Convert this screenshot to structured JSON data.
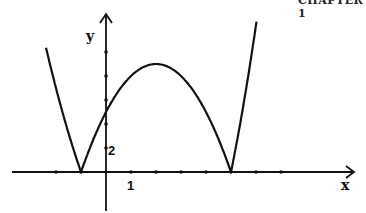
{
  "header": {
    "text": "CHAPTER 1"
  },
  "chart_data": {
    "type": "line",
    "title": "",
    "xlabel": "x",
    "ylabel": "y",
    "function": "y = |x^2 - 4x - 5|",
    "tick_labels": {
      "x": [
        "1"
      ],
      "y": [
        "2"
      ]
    },
    "x_ticks": [
      -2,
      -1,
      1,
      2,
      3,
      4,
      5,
      6,
      7
    ],
    "y_ticks": [
      2,
      4,
      6,
      8,
      10
    ],
    "xlim": [
      -3.8,
      10
    ],
    "ylim": [
      -3.3,
      14
    ],
    "grid": false,
    "legend": null,
    "key_points": [
      {
        "x": -1,
        "y": 0,
        "label": "root"
      },
      {
        "x": 5,
        "y": 0,
        "label": "root"
      },
      {
        "x": 2,
        "y": 9,
        "label": "local max"
      },
      {
        "x": 0,
        "y": 5,
        "label": "y-intercept"
      }
    ],
    "series": [
      {
        "name": "|x^2-4x-5|",
        "x": [
          -2.4,
          -2,
          -1.5,
          -1,
          -0.5,
          0,
          0.5,
          1,
          1.5,
          2,
          2.5,
          3,
          3.5,
          4,
          4.5,
          5,
          5.5,
          6,
          6.2
        ],
        "y": [
          10.4,
          7,
          3.25,
          0,
          2.75,
          5,
          6.75,
          8,
          8.75,
          9,
          8.75,
          8,
          6.75,
          5,
          2.75,
          0,
          3.25,
          7,
          8.6
        ]
      }
    ]
  }
}
